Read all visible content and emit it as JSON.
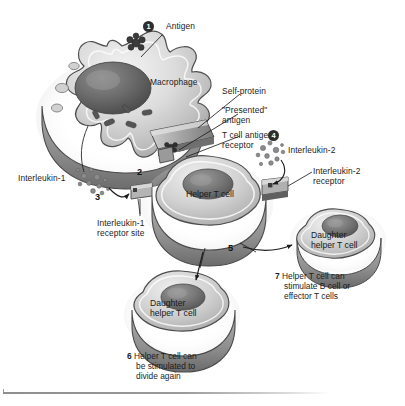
{
  "figure": {
    "kind": "biology-diagram",
    "palette": {
      "cell_light": "#e9e9e9",
      "cell_mid": "#b8b8b8",
      "cell_dark": "#6f6f6f",
      "nucleus": "#575757",
      "outline": "#3a3a3a",
      "text": "#1c1c1c",
      "marker_fill": "#2e2e2e",
      "marker_text": "#ffffff",
      "background": "#ffffff"
    }
  },
  "labels": {
    "antigen": "Antigen",
    "macrophage": "Macrophage",
    "self_protein": "Self-protein",
    "presented_antigen_line1": "\"Presented\"",
    "presented_antigen_line2": "antigen",
    "t_cell_antigen_receptor_line1": "T cell antigen",
    "t_cell_antigen_receptor_line2": "receptor",
    "interleukin_1": "Interleukin-1",
    "interleukin_2": "Interleukin-2",
    "interleukin_2_receptor_line1": "Interleukin-2",
    "interleukin_2_receptor_line2": "receptor",
    "interleukin_1_receptor_site_line1": "Interleukin-1",
    "interleukin_1_receptor_site_line2": "receptor site",
    "helper_t_cell": "Helper T cell",
    "daughter_helper_t_cell_line1": "Daughter",
    "daughter_helper_t_cell_line2": "helper T cell"
  },
  "steps": [
    {
      "id": 1,
      "number": "1",
      "style": "circled",
      "caption": ""
    },
    {
      "id": 2,
      "number": "2",
      "style": "plain",
      "caption": ""
    },
    {
      "id": 3,
      "number": "3",
      "style": "plain",
      "caption": ""
    },
    {
      "id": 4,
      "number": "4",
      "style": "circled",
      "caption": ""
    },
    {
      "id": 5,
      "number": "5",
      "style": "plain",
      "caption": ""
    },
    {
      "id": 6,
      "number": "6",
      "style": "plain",
      "caption_line1": "Helper T cell can",
      "caption_line2": "be stimulated to",
      "caption_line3": "divide again"
    },
    {
      "id": 7,
      "number": "7",
      "style": "plain",
      "caption_line1": "Helper T cell can",
      "caption_line2": "stimulate B cell or",
      "caption_line3": "effector T cells"
    }
  ],
  "cells": [
    {
      "name": "macrophage",
      "label": "Macrophage"
    },
    {
      "name": "helper-t-cell",
      "label": "Helper T cell"
    },
    {
      "name": "daughter-helper-t-cell-right",
      "label": "Daughter helper T cell"
    },
    {
      "name": "daughter-helper-t-cell-bottom",
      "label": "Daughter helper T cell"
    }
  ]
}
